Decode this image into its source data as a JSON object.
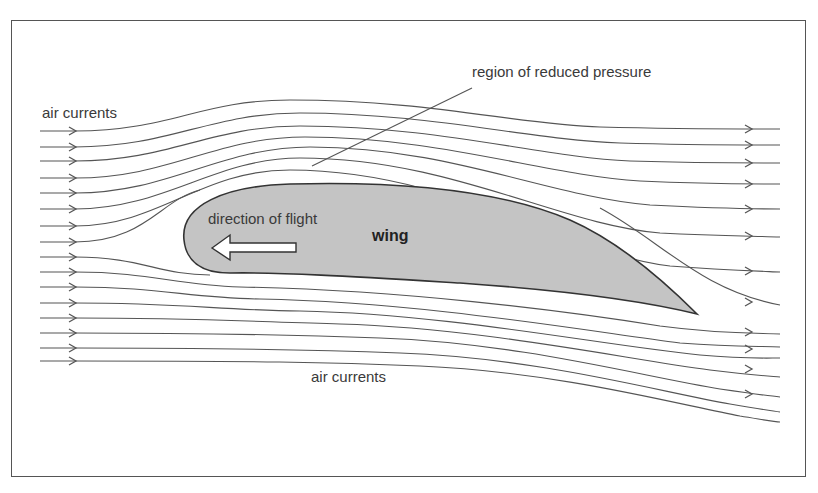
{
  "diagram": {
    "labels": {
      "air_currents_top": "air currents",
      "air_currents_bottom": "air currents",
      "region": "region of reduced pressure",
      "direction": "direction of flight",
      "wing": "wing"
    },
    "colors": {
      "wing_fill": "#c4c4c4",
      "wing_stroke": "#333333",
      "streamline": "#555555",
      "text": "#3a3a3a",
      "frame": "#555555"
    },
    "streamlines": {
      "count_left": 16,
      "count_right": 16,
      "flow_direction": "left-to-right"
    },
    "wing_shape": {
      "leading_edge": [
        184,
        240
      ],
      "trailing_edge": [
        697,
        314
      ]
    },
    "flight_arrow": {
      "direction": "left",
      "fill": "#ffffff"
    }
  }
}
